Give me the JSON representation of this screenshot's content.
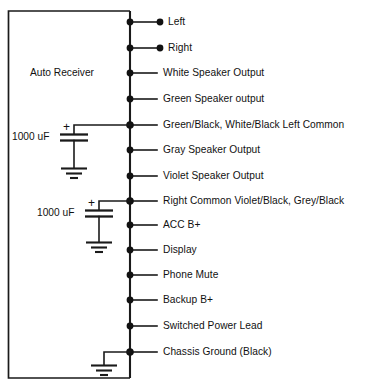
{
  "diagram": {
    "title_block": "Auto Receiver",
    "background_color": "#ffffff",
    "line_color": "#1a1a1a",
    "pins": [
      {
        "label": "Left",
        "y": 22,
        "terminal_dot": true
      },
      {
        "label": "Right",
        "y": 48,
        "terminal_dot": true
      },
      {
        "label": "White Speaker Output",
        "y": 73,
        "terminal_dot": false
      },
      {
        "label": "Green Speaker output",
        "y": 99,
        "terminal_dot": false
      },
      {
        "label": "Green/Black, White/Black Left Common",
        "y": 125,
        "terminal_dot": false
      },
      {
        "label": "Gray Speaker Output",
        "y": 150,
        "terminal_dot": false
      },
      {
        "label": "Violet Speaker Output",
        "y": 176,
        "terminal_dot": false
      },
      {
        "label": "Right Common Violet/Black, Grey/Black",
        "y": 201,
        "terminal_dot": false
      },
      {
        "label": "ACC B+",
        "y": 225,
        "terminal_dot": false
      },
      {
        "label": "Display",
        "y": 250,
        "terminal_dot": false
      },
      {
        "label": "Phone Mute",
        "y": 275,
        "terminal_dot": false
      },
      {
        "label": "Backup B+",
        "y": 300,
        "terminal_dot": false
      },
      {
        "label": "Switched Power Lead",
        "y": 326,
        "terminal_dot": false
      },
      {
        "label": "Chassis Ground (Black)",
        "y": 352,
        "terminal_dot": false
      }
    ],
    "capacitors": [
      {
        "value": "1000 uF",
        "polarity": "+",
        "attached_pin": "Green/Black, White/Black Left Common"
      },
      {
        "value": "1000 uF",
        "polarity": "+",
        "attached_pin": "Right Common Violet/Black, Grey/Black"
      }
    ],
    "grounds": [
      {
        "name": "capacitor-1-ground"
      },
      {
        "name": "capacitor-2-ground"
      },
      {
        "name": "chassis-ground"
      }
    ]
  }
}
